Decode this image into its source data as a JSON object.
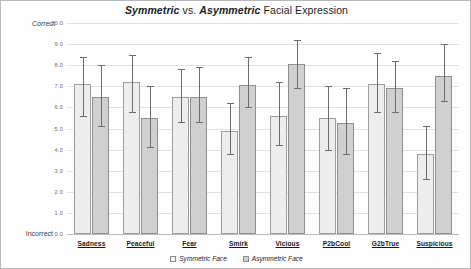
{
  "title": {
    "part1": "Symmetric",
    "part2": " vs. ",
    "part3": "Asymmetric",
    "part4": " Facial Expression",
    "full": "Symmetric vs. Asymmetric Facial Expression"
  },
  "axis": {
    "top_label": "Correct",
    "bottom_label": "Incorrect",
    "yticks": [
      "10.0",
      "9.0",
      "8.0",
      "7.0",
      "6.0",
      "5.0",
      "4.0",
      "3.0",
      "2.0",
      "1.0",
      "0.0"
    ]
  },
  "legend": {
    "items": [
      {
        "label": "Symmetric Face",
        "swatch": "light-gray-swatch",
        "color": "#f4f4f4"
      },
      {
        "label": "Asymmetric Face",
        "swatch": "dark-gray-swatch",
        "color": "#cfcfcf"
      }
    ]
  },
  "chart_data": {
    "type": "bar",
    "title": "Symmetric vs. Asymmetric Facial Expression",
    "xlabel": "",
    "ylabel": "",
    "ylim": [
      0.0,
      10.0
    ],
    "ytick_values": [
      0.0,
      1.0,
      2.0,
      3.0,
      4.0,
      5.0,
      6.0,
      7.0,
      8.0,
      9.0,
      10.0
    ],
    "y_axis_top_annotation": "Correct",
    "y_axis_bottom_annotation": "Incorrect",
    "grid": true,
    "legend_position": "bottom-center",
    "error_bars": true,
    "categories": [
      "Sadness",
      "Peaceful",
      "Fear",
      "Smirk",
      "Vicious",
      "P2bCool",
      "G2bTrue",
      "Suspicious"
    ],
    "series": [
      {
        "name": "Symmetric Face",
        "color": "#ededed",
        "values": [
          7.1,
          7.2,
          6.5,
          4.9,
          5.6,
          5.5,
          7.1,
          3.8
        ],
        "err_low": [
          5.6,
          5.8,
          5.3,
          3.8,
          4.2,
          4.0,
          5.8,
          2.6
        ],
        "err_high": [
          8.4,
          8.5,
          7.8,
          6.2,
          7.2,
          7.0,
          8.6,
          5.1
        ]
      },
      {
        "name": "Asymmetric Face",
        "color": "#d0d0d0",
        "values": [
          6.5,
          5.5,
          6.5,
          7.05,
          8.05,
          5.25,
          6.9,
          7.5
        ],
        "err_low": [
          5.1,
          4.1,
          5.3,
          6.0,
          6.9,
          3.8,
          5.8,
          6.3
        ],
        "err_high": [
          8.0,
          7.0,
          7.9,
          8.4,
          9.2,
          6.9,
          8.2,
          9.0
        ]
      }
    ]
  }
}
